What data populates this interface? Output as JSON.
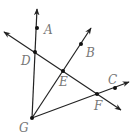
{
  "diagram": {
    "type": "geometry-rays",
    "colors": {
      "line": "#222222",
      "point": "#111111",
      "label": "#777777",
      "background": "#ffffff"
    },
    "points": [
      {
        "id": "A",
        "label": "A",
        "x": 37,
        "y": 28,
        "lx": 44,
        "ly": 34
      },
      {
        "id": "B",
        "label": "B",
        "x": 81,
        "y": 44,
        "lx": 86,
        "ly": 57
      },
      {
        "id": "C",
        "label": "C",
        "x": 115,
        "y": 88,
        "lx": 108,
        "ly": 84
      },
      {
        "id": "D",
        "label": "D",
        "x": 35,
        "y": 52,
        "lx": 21,
        "ly": 65
      },
      {
        "id": "E",
        "label": "E",
        "x": 63,
        "y": 71,
        "lx": 59,
        "ly": 86
      },
      {
        "id": "F",
        "label": "F",
        "x": 97,
        "y": 94,
        "lx": 94,
        "ly": 110
      },
      {
        "id": "G",
        "label": "G",
        "x": 32,
        "y": 118,
        "lx": 19,
        "ly": 132
      }
    ],
    "rays": [
      {
        "name": "ray-GA",
        "from": "G",
        "through": "A"
      },
      {
        "name": "ray-GB",
        "from": "G",
        "through": "B"
      },
      {
        "name": "ray-GC",
        "from": "G",
        "through": "C"
      }
    ],
    "lines": [
      {
        "name": "line-DF",
        "through": [
          "D",
          "E",
          "F"
        ]
      }
    ]
  }
}
